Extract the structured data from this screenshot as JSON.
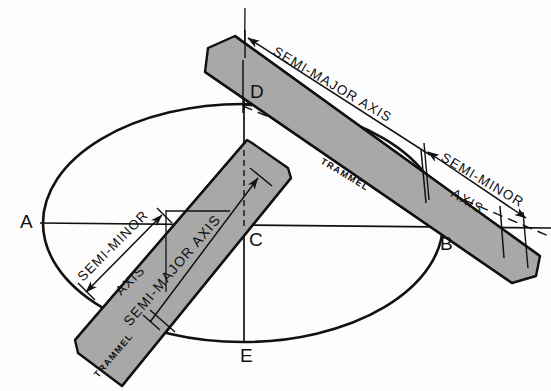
{
  "figure": {
    "type": "technical-drawing",
    "background_color": "#fdfdfd",
    "ink_color": "#111111",
    "strip_fill_color": "#a8a8a8",
    "strip_edge_color": "#111111"
  },
  "points": {
    "a": {
      "label": "A",
      "x": 27,
      "y": 221
    },
    "b": {
      "label": "B",
      "x": 446,
      "y": 243
    },
    "c": {
      "label": "C",
      "x": 249,
      "y": 243
    },
    "d": {
      "label": "D",
      "x": 250,
      "y": 95
    },
    "e": {
      "label": "E",
      "x": 247,
      "y": 360
    }
  },
  "ellipse": {
    "center_x": 243,
    "center_y": 223,
    "semi_major": 200,
    "semi_minor": 119
  },
  "labels": {
    "semi_major_upper": "SEMI-MAJOR AXIS",
    "semi_minor_upper_line1": "SEMI-MINOR",
    "semi_minor_upper_line2": "AXIS",
    "trammel_upper": "TRAMMEL",
    "semi_minor_lower_line1": "SEMI-MINOR",
    "semi_minor_lower_line2": "AXIS",
    "semi_major_lower": "SEMI-MAJOR AXIS",
    "trammel_lower": "TRAMMEL"
  }
}
